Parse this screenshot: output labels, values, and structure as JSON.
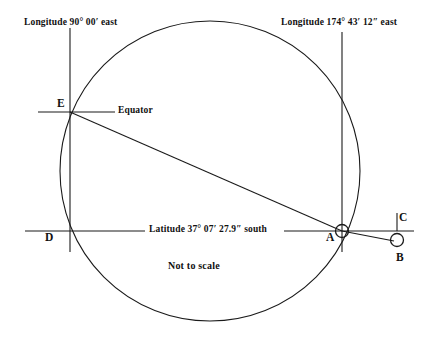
{
  "figure": {
    "title": "Not to scale",
    "stroke_color": "#1a1a1a",
    "background_color": "#ffffff",
    "annotations": {
      "longitude_left": "Longitude 90° 00′ east",
      "longitude_right": "Longitude 174° 43′ 12″ east",
      "equator": "Equator",
      "latitude": "Latitude 37° 07′ 27.9″ south",
      "not_to_scale": "Not to scale"
    },
    "points": [
      {
        "id": "E",
        "label": "E",
        "x": 70,
        "y": 112,
        "marker": "intersection"
      },
      {
        "id": "D",
        "label": "D",
        "x": 70,
        "y": 231,
        "marker": "intersection"
      },
      {
        "id": "A",
        "label": "A",
        "x": 342,
        "y": 231,
        "marker": "circle"
      },
      {
        "id": "B",
        "label": "B",
        "x": 397,
        "y": 240,
        "marker": "circle"
      },
      {
        "id": "C",
        "label": "C",
        "x": 397,
        "y": 222,
        "marker": "tick"
      }
    ],
    "great_circle": {
      "cx": 210,
      "cy": 171,
      "r": 150
    },
    "meridian_left": {
      "x": 70,
      "y1": 28,
      "y2": 252
    },
    "meridian_right": {
      "x": 342,
      "y1": 32,
      "y2": 252
    },
    "equator_line": {
      "y": 112,
      "x1": 38,
      "x2": 115
    },
    "latitude_line": {
      "y": 231,
      "x1": 25,
      "x2": 414
    },
    "chord_e_to_a": {
      "x1": 70,
      "y1": 112,
      "x2": 342,
      "y2": 231
    },
    "segment_a_to_b": {
      "x1": 342,
      "y1": 231,
      "x2": 394,
      "y2": 241
    },
    "tick_c": {
      "x": 397,
      "y1": 214,
      "y2": 231
    }
  }
}
